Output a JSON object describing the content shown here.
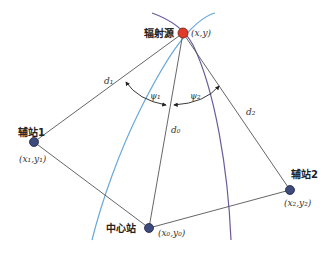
{
  "diagram": {
    "colors": {
      "line": "#555555",
      "source_fill": "#e03a2a",
      "station_fill": "#3d4a7a",
      "curve_blue": "#6aa8d8",
      "curve_purple": "#6b5a9a"
    },
    "source": {
      "label": "辐射源",
      "coord": "(x,y)"
    },
    "aux1": {
      "label": "辅站1",
      "coord": "(x₁,y₁)"
    },
    "aux2": {
      "label": "辅站2",
      "coord": "(x₂,y₂)"
    },
    "center": {
      "label": "中心站",
      "coord": "(x₀,y₀)"
    },
    "distances": {
      "d0": "d₀",
      "d1": "d₁",
      "d2": "d₂"
    },
    "angles": {
      "psi1": "ψ₁",
      "psi2": "ψ₂"
    }
  }
}
